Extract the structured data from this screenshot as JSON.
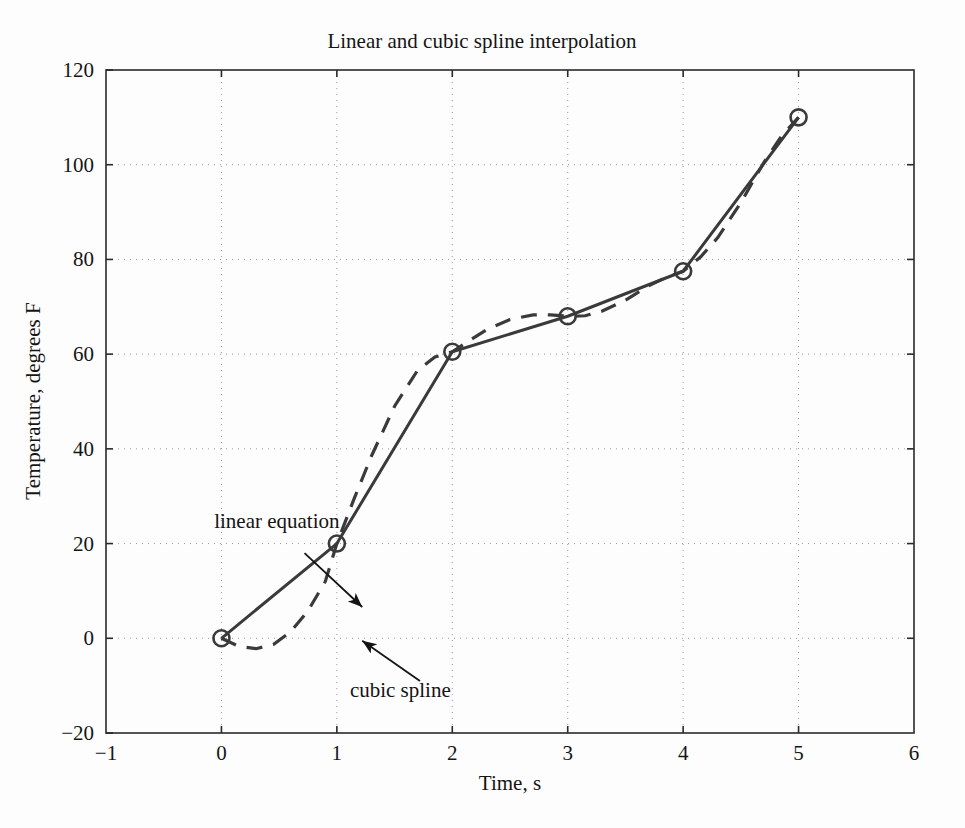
{
  "chart_data": {
    "type": "line",
    "title": "Linear and cubic spline interpolation",
    "xlabel": "Time, s",
    "ylabel": "Temperature, degrees F",
    "xlim": [
      -1,
      6
    ],
    "ylim": [
      -20,
      120
    ],
    "xticks": [
      -1,
      0,
      1,
      2,
      3,
      4,
      5,
      6
    ],
    "xticklabels": [
      "−1",
      "0",
      "1",
      "2",
      "3",
      "4",
      "5",
      "6"
    ],
    "yticks": [
      -20,
      0,
      20,
      40,
      60,
      80,
      100,
      120
    ],
    "yticklabels": [
      "−20",
      "0",
      "20",
      "40",
      "60",
      "80",
      "100",
      "120"
    ],
    "grid": true,
    "grid_style": "dotted",
    "legend": "none",
    "x": [
      0,
      1,
      2,
      3,
      4,
      5
    ],
    "series": [
      {
        "name": "linear equation",
        "style": "solid",
        "marker": "circle",
        "color": "#3a3a3a",
        "values": [
          0,
          20,
          60.5,
          68,
          77.5,
          110
        ]
      },
      {
        "name": "cubic spline",
        "style": "dashed",
        "marker": "none",
        "color": "#3a3a3a",
        "values": [
          0,
          20,
          60.5,
          68,
          77.5,
          110
        ],
        "spline_samples_x": [
          0,
          0.15,
          0.3,
          0.45,
          0.6,
          0.75,
          0.9,
          1,
          1.15,
          1.3,
          1.5,
          1.7,
          1.85,
          2,
          2.15,
          2.3,
          2.5,
          2.7,
          2.85,
          3,
          3.15,
          3.3,
          3.5,
          3.7,
          3.85,
          4,
          4.15,
          4.3,
          4.5,
          4.7,
          4.85,
          5
        ],
        "spline_samples_y": [
          0,
          -1.7,
          -2.2,
          -1.3,
          1.4,
          5.8,
          12.0,
          20,
          29.5,
          38.5,
          49.0,
          56.6,
          59.4,
          60.5,
          62.9,
          65.2,
          67.3,
          68.3,
          68.3,
          68,
          68.1,
          69.1,
          71.4,
          74.4,
          76.2,
          77.5,
          80.5,
          84.6,
          92.0,
          100.5,
          106.0,
          110
        ]
      }
    ],
    "annotations": [
      {
        "name": "linear equation",
        "text": "linear equation",
        "text_x": 0.48,
        "text_y": 23.2,
        "arrow_from_x": 0.72,
        "arrow_from_y": 18.0,
        "arrow_to_x": 1.22,
        "arrow_to_y": 6.6
      },
      {
        "name": "cubic spline",
        "text": "cubic spline",
        "text_x": 1.55,
        "text_y": -12.3,
        "arrow_from_x": 1.72,
        "arrow_from_y": -9.0,
        "arrow_to_x": 1.22,
        "arrow_to_y": -0.5
      }
    ]
  }
}
